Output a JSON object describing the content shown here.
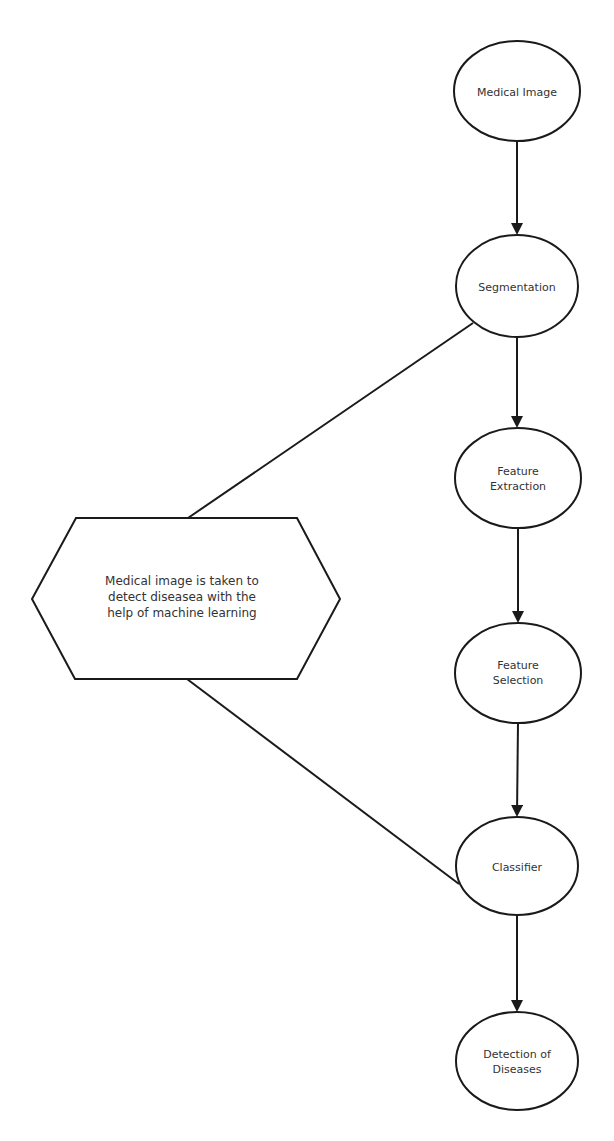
{
  "diagram": {
    "type": "flowchart",
    "colors": {
      "stroke": "#1a1a1a",
      "text": "#333333",
      "background": "#ffffff"
    },
    "nodes": [
      {
        "id": "medical-image",
        "label": "Medical Image",
        "shape": "ellipse",
        "cx": 517,
        "cy": 91,
        "rx": 63,
        "ry": 50
      },
      {
        "id": "segmentation",
        "label": "Segmentation",
        "shape": "ellipse",
        "cx": 517,
        "cy": 286,
        "rx": 61,
        "ry": 51
      },
      {
        "id": "feature-extraction",
        "label": "Feature\nExtraction",
        "shape": "ellipse",
        "cx": 518,
        "cy": 478,
        "rx": 63,
        "ry": 50
      },
      {
        "id": "feature-selection",
        "label": "Feature\nSelection",
        "shape": "ellipse",
        "cx": 518,
        "cy": 673,
        "rx": 63,
        "ry": 50
      },
      {
        "id": "classifier",
        "label": "Classifier",
        "shape": "ellipse",
        "cx": 517,
        "cy": 866,
        "rx": 61,
        "ry": 49
      },
      {
        "id": "detection-of-diseases",
        "label": "Detection of\nDiseases",
        "shape": "ellipse",
        "cx": 517,
        "cy": 1061,
        "rx": 61,
        "ry": 49
      }
    ],
    "edges": [
      {
        "from": "medical-image",
        "to": "segmentation",
        "arrow": true
      },
      {
        "from": "segmentation",
        "to": "feature-extraction",
        "arrow": true
      },
      {
        "from": "feature-extraction",
        "to": "feature-selection",
        "arrow": true
      },
      {
        "from": "feature-selection",
        "to": "classifier",
        "arrow": true
      },
      {
        "from": "classifier",
        "to": "detection-of-diseases",
        "arrow": true
      }
    ],
    "annotation": {
      "id": "annotation-hexagon",
      "label": "Medical image is taken to\ndetect diseasea with the\nhelp of machine learning",
      "shape": "hexagon",
      "connects_to": [
        "segmentation",
        "classifier"
      ]
    }
  }
}
